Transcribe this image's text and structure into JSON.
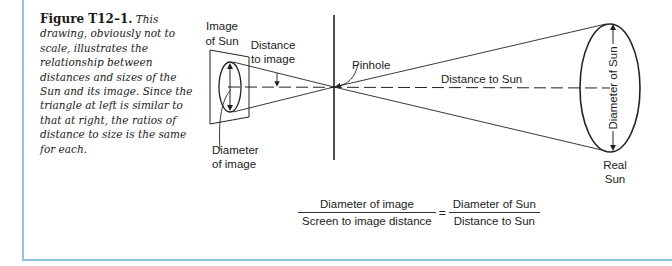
{
  "caption": {
    "label": "Figure T12–1.",
    "text": "This drawing, obviously not to scale, illustrates the relationship between distances and sizes of the Sun and its image. Since the triangle at left is similar to that at right, the ratios of distance to size is the same for each."
  },
  "diagram": {
    "labels": {
      "image_of_sun_line1": "Image",
      "image_of_sun_line2": "of Sun",
      "distance_to_image_line1": "Distance",
      "distance_to_image_line2": "to image",
      "pinhole": "Pinhole",
      "distance_to_sun": "Distance to Sun",
      "diameter_of_sun": "Diameter of Sun",
      "diameter_of_image_line1": "Diameter",
      "diameter_of_image_line2": "of image",
      "real_sun_line1": "Real",
      "real_sun_line2": "Sun"
    }
  },
  "formula": {
    "left_numerator": "Diameter of image",
    "left_denominator": "Screen to image distance",
    "equals": "=",
    "right_numerator": "Diameter of Sun",
    "right_denominator": "Distance to Sun"
  },
  "colors": {
    "frame": "#8fc3e0",
    "ink": "#222222"
  }
}
